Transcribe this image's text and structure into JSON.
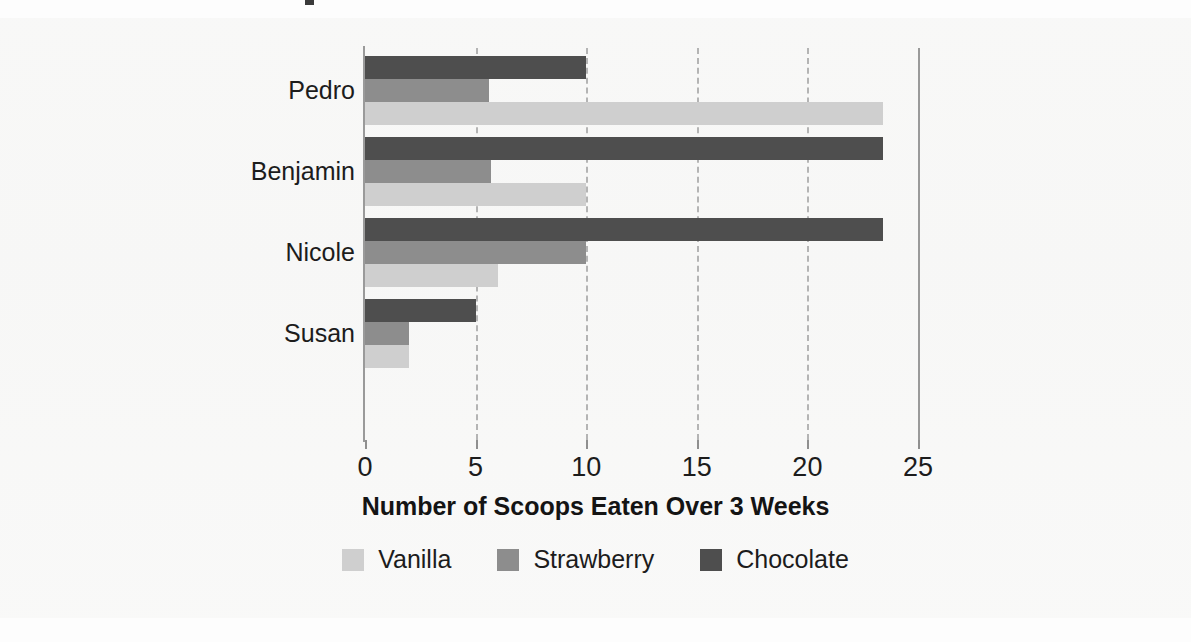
{
  "chart_data": {
    "type": "bar",
    "orientation": "horizontal",
    "title": "",
    "xlabel": "Number of Scoops Eaten Over 3 Weeks",
    "ylabel": "",
    "xlim": [
      0,
      25
    ],
    "xticks": [
      0,
      5,
      10,
      15,
      20,
      25
    ],
    "xtick_labels": [
      "0",
      "5",
      "10",
      "15",
      "20",
      "25"
    ],
    "grid": true,
    "grid_axis": "x",
    "grid_style": "dashed",
    "legend_position": "bottom",
    "categories": [
      "Pedro",
      "Benjamin",
      "Nicole",
      "Susan"
    ],
    "series": [
      {
        "name": "Vanilla",
        "color": "#cfcfcf",
        "values": [
          23.4,
          10,
          6,
          2
        ]
      },
      {
        "name": "Strawberry",
        "color": "#8d8d8d",
        "values": [
          5.6,
          5.7,
          10,
          2
        ]
      },
      {
        "name": "Chocolate",
        "color": "#4e4e4e",
        "values": [
          10,
          23.4,
          23.4,
          5
        ]
      }
    ],
    "series_draw_order_top_to_bottom": [
      "Chocolate",
      "Strawberry",
      "Vanilla"
    ]
  },
  "axis": {
    "x_title": "Number of Scoops Eaten Over 3 Weeks",
    "ticks": [
      {
        "value": 0,
        "label": "0"
      },
      {
        "value": 5,
        "label": "5"
      },
      {
        "value": 10,
        "label": "10"
      },
      {
        "value": 15,
        "label": "15"
      },
      {
        "value": 20,
        "label": "20"
      },
      {
        "value": 25,
        "label": "25"
      }
    ]
  },
  "categories": [
    {
      "label": "Pedro"
    },
    {
      "label": "Benjamin"
    },
    {
      "label": "Nicole"
    },
    {
      "label": "Susan"
    }
  ],
  "legend": [
    {
      "label": "Vanilla",
      "color": "#cfcfcf"
    },
    {
      "label": "Strawberry",
      "color": "#8d8d8d"
    },
    {
      "label": "Chocolate",
      "color": "#4e4e4e"
    }
  ],
  "colors": {
    "vanilla": "#cfcfcf",
    "strawberry": "#8d8d8d",
    "chocolate": "#4e4e4e",
    "axis": "#9a9a9a",
    "grid": "#b4b4b4",
    "text": "#1c1c1c",
    "background": "#fdfdfd"
  }
}
